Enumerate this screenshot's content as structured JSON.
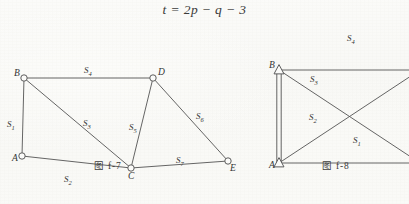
{
  "equation": {
    "text": "t = 2p − q − 3"
  },
  "colors": {
    "paper": "#fbfbf9",
    "ink": "#3a3a3a",
    "line": "#545454"
  },
  "figures": [
    {
      "id": "f-7",
      "caption": "图 f-7",
      "nodes": [
        {
          "name": "A",
          "label": "A",
          "marker": "circle",
          "x": 22,
          "y": 128
        },
        {
          "name": "B",
          "label": "B",
          "marker": "circle",
          "x": 24,
          "y": 50
        },
        {
          "name": "C",
          "label": "C",
          "marker": "circle",
          "x": 131,
          "y": 140
        },
        {
          "name": "D",
          "label": "D",
          "marker": "circle",
          "x": 153,
          "y": 50
        },
        {
          "name": "E",
          "label": "E",
          "marker": "circle",
          "x": 228,
          "y": 133
        }
      ],
      "edges": [
        {
          "name": "A-B",
          "label": "S",
          "sub": "1",
          "from": "A",
          "to": "B",
          "lx": 7,
          "ly": 92
        },
        {
          "name": "A-C",
          "label": "S",
          "sub": "2",
          "from": "A",
          "to": "C",
          "lx": 64,
          "ly": 147
        },
        {
          "name": "B-C",
          "label": "S",
          "sub": "3",
          "from": "B",
          "to": "C",
          "lx": 83,
          "ly": 91
        },
        {
          "name": "B-D",
          "label": "S",
          "sub": "4",
          "from": "B",
          "to": "D",
          "lx": 84,
          "ly": 38
        },
        {
          "name": "C-D",
          "label": "S",
          "sub": "5",
          "from": "C",
          "to": "D",
          "lx": 129,
          "ly": 95
        },
        {
          "name": "D-E",
          "label": "S",
          "sub": "6",
          "from": "D",
          "to": "E",
          "lx": 196,
          "ly": 84
        },
        {
          "name": "C-E",
          "label": "S",
          "sub": "7",
          "from": "C",
          "to": "E",
          "lx": 176,
          "ly": 128
        }
      ]
    },
    {
      "id": "f-8",
      "caption": "图 f-8",
      "nodes": [
        {
          "name": "A",
          "label": "A",
          "marker": "triangle",
          "x": 27,
          "y": 135
        },
        {
          "name": "B",
          "label": "B",
          "marker": "triangle",
          "x": 27,
          "y": 42
        },
        {
          "name": "C",
          "label": "",
          "marker": "none",
          "x": 168,
          "y": 42
        },
        {
          "name": "D",
          "label": "",
          "marker": "none",
          "x": 168,
          "y": 135
        }
      ],
      "edges": [
        {
          "name": "A-B-double",
          "label": "",
          "sub": "",
          "from": "A",
          "to": "B",
          "lx": 0,
          "ly": 0
        },
        {
          "name": "A-D",
          "label": "S",
          "sub": "1",
          "from": "A",
          "to": "D",
          "lx": 101,
          "ly": 108
        },
        {
          "name": "A-C",
          "label": "S",
          "sub": "2",
          "from": "A",
          "to": "C",
          "lx": 57,
          "ly": 85
        },
        {
          "name": "B-D",
          "label": "S",
          "sub": "3",
          "from": "B",
          "to": "D",
          "lx": 58,
          "ly": 47
        },
        {
          "name": "B-C",
          "label": "S",
          "sub": "4",
          "from": "B",
          "to": "C",
          "lx": 95,
          "ly": 6
        }
      ]
    }
  ]
}
